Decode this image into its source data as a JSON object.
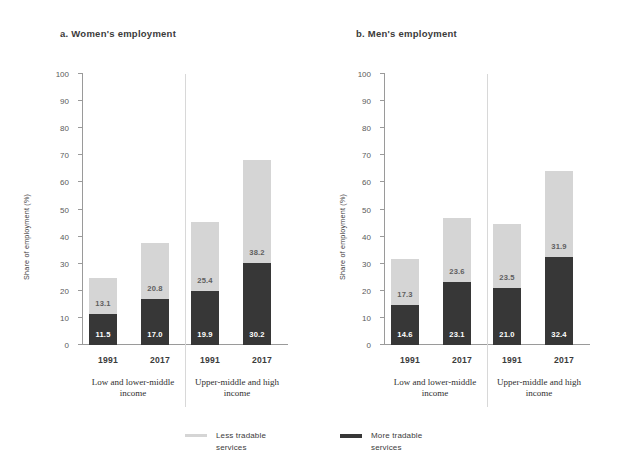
{
  "figure": {
    "y_axis_label": "Share of employment (%)",
    "y_ticks": [
      "0",
      "10",
      "20",
      "30",
      "40",
      "50",
      "60",
      "70",
      "80",
      "90",
      "100"
    ],
    "colors": {
      "less_tradable": "#d5d5d5",
      "more_tradable": "#373737",
      "axis": "#9a9a9a"
    }
  },
  "legend": {
    "items": [
      {
        "label": "Less tradable services",
        "color": "#d5d5d5",
        "key": "less"
      },
      {
        "label": "More tradable services",
        "color": "#373737",
        "key": "more"
      }
    ],
    "less_label": "Less tradable services",
    "more_label": "More tradable services"
  },
  "panels": {
    "a": {
      "title": "a. Women's employment"
    },
    "b": {
      "title": "b. Men's employment"
    }
  },
  "groups": {
    "low": "Low and lower-middle income",
    "high": "Upper-middle and high income"
  },
  "years": {
    "y1991": "1991",
    "y2017": "2017"
  },
  "chart_data": [
    {
      "type": "bar",
      "subtype": "stacked",
      "title": "a. Women's employment",
      "xlabel": "",
      "ylabel": "Share of employment (%)",
      "ylim": [
        0,
        100
      ],
      "ytick_step": 10,
      "grid": false,
      "legend_position": "bottom",
      "group_labels": [
        "Low and lower-middle income",
        "Upper-middle and high income"
      ],
      "categories": [
        "1991",
        "2017",
        "1991",
        "2017"
      ],
      "series": [
        {
          "name": "More tradable services",
          "color": "#373737",
          "values": [
            11.5,
            17.0,
            19.9,
            30.2
          ]
        },
        {
          "name": "Less tradable services",
          "color": "#d5d5d5",
          "values": [
            13.1,
            20.8,
            25.4,
            38.2
          ]
        }
      ],
      "totals": [
        24.6,
        37.8,
        45.3,
        68.4
      ]
    },
    {
      "type": "bar",
      "subtype": "stacked",
      "title": "b. Men's employment",
      "xlabel": "",
      "ylabel": "Share of employment (%)",
      "ylim": [
        0,
        100
      ],
      "ytick_step": 10,
      "grid": false,
      "legend_position": "bottom",
      "group_labels": [
        "Low and lower-middle income",
        "Upper-middle and high income"
      ],
      "categories": [
        "1991",
        "2017",
        "1991",
        "2017"
      ],
      "series": [
        {
          "name": "More tradable services",
          "color": "#373737",
          "values": [
            14.6,
            23.1,
            21.0,
            32.4
          ]
        },
        {
          "name": "Less tradable services",
          "color": "#d5d5d5",
          "values": [
            17.3,
            23.6,
            23.5,
            31.9
          ]
        }
      ],
      "totals": [
        31.9,
        46.7,
        44.5,
        64.3
      ]
    }
  ]
}
